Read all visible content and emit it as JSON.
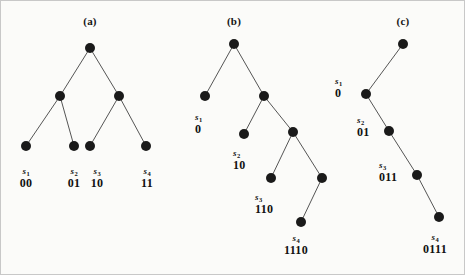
{
  "figure": {
    "background_color": "#fbfbf9",
    "ink_color": "#111111",
    "node_color": "#1a1a1a",
    "edge_color": "#555555",
    "node_radius": 5,
    "width": 465,
    "height": 275
  },
  "panels": [
    {
      "id": "a",
      "title": "(a)",
      "title_pos": [
        89,
        14
      ],
      "nodes": [
        {
          "name": "root",
          "x": 89,
          "y": 47
        },
        {
          "name": "internal-left",
          "x": 59,
          "y": 95
        },
        {
          "name": "internal-right",
          "x": 118,
          "y": 95
        },
        {
          "name": "leaf-s1",
          "x": 25,
          "y": 145
        },
        {
          "name": "leaf-s2",
          "x": 73,
          "y": 145
        },
        {
          "name": "leaf-s3",
          "x": 89,
          "y": 145
        },
        {
          "name": "leaf-s4",
          "x": 145,
          "y": 145
        }
      ],
      "edges": [
        [
          89,
          47,
          59,
          95
        ],
        [
          89,
          47,
          118,
          95
        ],
        [
          59,
          95,
          25,
          145
        ],
        [
          59,
          95,
          73,
          145
        ],
        [
          118,
          95,
          89,
          145
        ],
        [
          118,
          95,
          145,
          145
        ]
      ],
      "labels": [
        {
          "symbol": "s",
          "index": "1",
          "code": "00",
          "x": 25,
          "y": 166,
          "align": "center"
        },
        {
          "symbol": "s",
          "index": "2",
          "code": "01",
          "x": 73,
          "y": 166,
          "align": "center"
        },
        {
          "symbol": "s",
          "index": "3",
          "code": "10",
          "x": 96,
          "y": 166,
          "align": "center"
        },
        {
          "symbol": "s",
          "index": "4",
          "code": "11",
          "x": 146,
          "y": 166,
          "align": "center"
        }
      ]
    },
    {
      "id": "b",
      "title": "(b)",
      "title_pos": [
        233,
        14
      ],
      "nodes": [
        {
          "name": "root",
          "x": 233,
          "y": 43
        },
        {
          "name": "leaf-s1",
          "x": 204,
          "y": 95
        },
        {
          "name": "internal-1",
          "x": 263,
          "y": 95
        },
        {
          "name": "leaf-s2",
          "x": 243,
          "y": 133
        },
        {
          "name": "internal-2",
          "x": 292,
          "y": 131
        },
        {
          "name": "leaf-s3",
          "x": 270,
          "y": 177
        },
        {
          "name": "internal-3",
          "x": 321,
          "y": 177
        },
        {
          "name": "leaf-s4",
          "x": 300,
          "y": 221
        }
      ],
      "edges": [
        [
          233,
          43,
          204,
          95
        ],
        [
          233,
          43,
          263,
          95
        ],
        [
          263,
          95,
          243,
          133
        ],
        [
          263,
          95,
          292,
          131
        ],
        [
          292,
          131,
          270,
          177
        ],
        [
          292,
          131,
          321,
          177
        ],
        [
          321,
          177,
          300,
          221
        ]
      ],
      "labels": [
        {
          "symbol": "s",
          "index": "1",
          "code": "0",
          "x": 194,
          "y": 112,
          "align": "left"
        },
        {
          "symbol": "s",
          "index": "2",
          "code": "10",
          "x": 232,
          "y": 148,
          "align": "left"
        },
        {
          "symbol": "s",
          "index": "3",
          "code": "110",
          "x": 254,
          "y": 192,
          "align": "left"
        },
        {
          "symbol": "s",
          "index": "4",
          "code": "1110",
          "x": 295,
          "y": 233,
          "align": "center"
        }
      ]
    },
    {
      "id": "c",
      "title": "(c)",
      "title_pos": [
        402,
        14
      ],
      "nodes": [
        {
          "name": "root",
          "x": 402,
          "y": 43
        },
        {
          "name": "node-s1",
          "x": 365,
          "y": 93
        },
        {
          "name": "node-s2",
          "x": 388,
          "y": 130
        },
        {
          "name": "node-s3",
          "x": 416,
          "y": 174
        },
        {
          "name": "node-s4",
          "x": 438,
          "y": 216
        }
      ],
      "edges": [
        [
          402,
          43,
          365,
          93
        ],
        [
          365,
          93,
          388,
          130
        ],
        [
          388,
          130,
          416,
          174
        ],
        [
          416,
          174,
          438,
          216
        ]
      ],
      "labels": [
        {
          "symbol": "s",
          "index": "1",
          "code": "0",
          "x": 334,
          "y": 76,
          "align": "left"
        },
        {
          "symbol": "s",
          "index": "2",
          "code": "01",
          "x": 356,
          "y": 115,
          "align": "left"
        },
        {
          "symbol": "s",
          "index": "3",
          "code": "011",
          "x": 378,
          "y": 160,
          "align": "left"
        },
        {
          "symbol": "s",
          "index": "4",
          "code": "0111",
          "x": 434,
          "y": 232,
          "align": "center"
        }
      ]
    }
  ]
}
